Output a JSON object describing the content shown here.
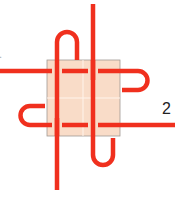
{
  "diagram": {
    "type": "knot-diagram",
    "labels": {
      "end_1": "1",
      "end_2": "2"
    },
    "colors": {
      "cord": "#f0301e",
      "square_fill": "#f9dcc8",
      "square_border": "#a09a94",
      "grid": "#fff4ec"
    }
  }
}
